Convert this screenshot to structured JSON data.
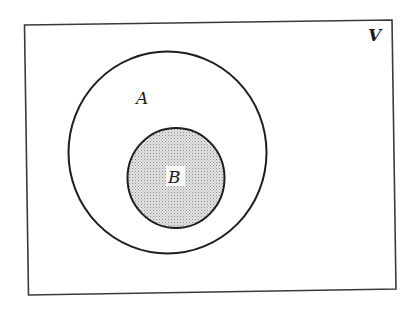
{
  "diagram": {
    "type": "venn",
    "title": "",
    "universe": {
      "label": "V",
      "stroke": "#3a3a3a"
    },
    "sets": [
      {
        "id": "A",
        "label": "A",
        "fill": "none",
        "stroke": "#1e1e1e",
        "contains": [
          "B"
        ]
      },
      {
        "id": "B",
        "label": "B",
        "fill": "#d6d6d6",
        "pattern": "stipple",
        "stroke": "#1e1e1e",
        "shaded": true
      }
    ],
    "relation": "B ⊂ A ⊂ V"
  }
}
